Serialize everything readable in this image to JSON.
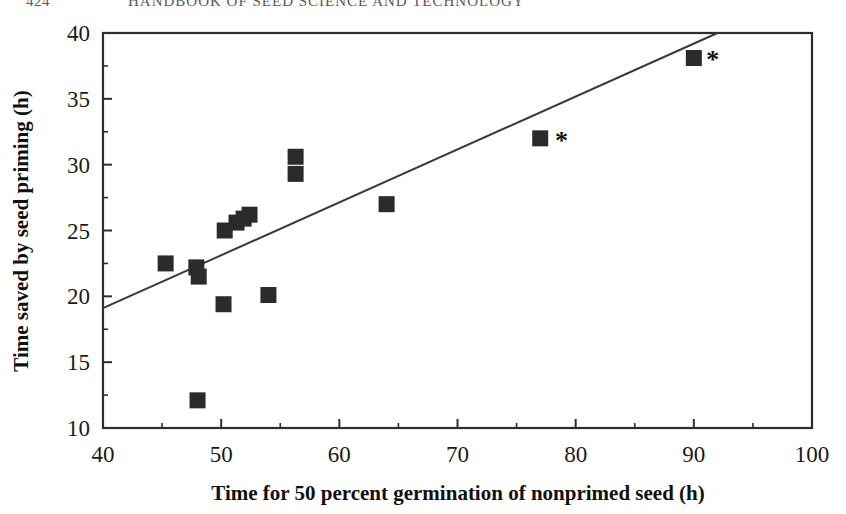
{
  "header": {
    "page_number": "424",
    "title": "HANDBOOK OF SEED SCIENCE AND TECHNOLOGY"
  },
  "chart_data": {
    "type": "scatter",
    "title": "",
    "xlabel": "Time for 50 percent germination of nonprimed seed (h)",
    "ylabel": "Time saved by seed priming (h)",
    "xlim": [
      40,
      100
    ],
    "ylim": [
      10,
      40
    ],
    "x_ticks": [
      40,
      50,
      60,
      70,
      80,
      90,
      100
    ],
    "x_tick_labels": [
      "40",
      "50",
      "60",
      "70",
      "80",
      "90",
      "100"
    ],
    "y_ticks": [
      10,
      15,
      20,
      25,
      30,
      35,
      40
    ],
    "y_tick_labels": [
      "10",
      "15",
      "20",
      "25",
      "30",
      "35",
      "40"
    ],
    "x_minor_ticks": [
      45,
      55,
      65,
      75,
      85,
      95
    ],
    "y_minor_ticks": [
      12.5,
      17.5,
      22.5,
      27.5,
      32.5,
      37.5
    ],
    "grid": false,
    "legend": null,
    "marker": {
      "shape": "square",
      "color": "#2b2b2b",
      "size_px": 16
    },
    "series": [
      {
        "name": "Seed lots",
        "points": [
          {
            "x": 45.3,
            "y": 22.5,
            "starred": false
          },
          {
            "x": 47.9,
            "y": 22.2,
            "starred": false
          },
          {
            "x": 48.1,
            "y": 21.5,
            "starred": false
          },
          {
            "x": 48.0,
            "y": 12.1,
            "starred": false
          },
          {
            "x": 50.2,
            "y": 19.4,
            "starred": false
          },
          {
            "x": 50.3,
            "y": 25.0,
            "starred": false
          },
          {
            "x": 51.3,
            "y": 25.6,
            "starred": false
          },
          {
            "x": 51.9,
            "y": 25.9,
            "starred": false
          },
          {
            "x": 52.4,
            "y": 26.2,
            "starred": false
          },
          {
            "x": 54.0,
            "y": 20.1,
            "starred": false
          },
          {
            "x": 56.3,
            "y": 30.6,
            "starred": false
          },
          {
            "x": 56.3,
            "y": 29.3,
            "starred": false
          },
          {
            "x": 64.0,
            "y": 27.0,
            "starred": false
          },
          {
            "x": 77.0,
            "y": 32.0,
            "starred": true
          },
          {
            "x": 90.0,
            "y": 38.1,
            "starred": true
          }
        ]
      }
    ],
    "trendline": {
      "type": "linear",
      "x_start": 40.0,
      "y_start": 19.1,
      "x_end": 92.0,
      "y_end": 40.0,
      "color": "#3a3a3a"
    },
    "annotations": [
      {
        "symbol": "*",
        "x": 78.8,
        "y": 31.9
      },
      {
        "symbol": "*",
        "x": 91.6,
        "y": 38.0
      }
    ]
  },
  "colors": {
    "marker": "#2b2b2b",
    "axis": "#2e2e2e",
    "trendline": "#3a3a3a",
    "text": "#101010",
    "header_text": "#5a5a5a",
    "background": "#ffffff"
  }
}
